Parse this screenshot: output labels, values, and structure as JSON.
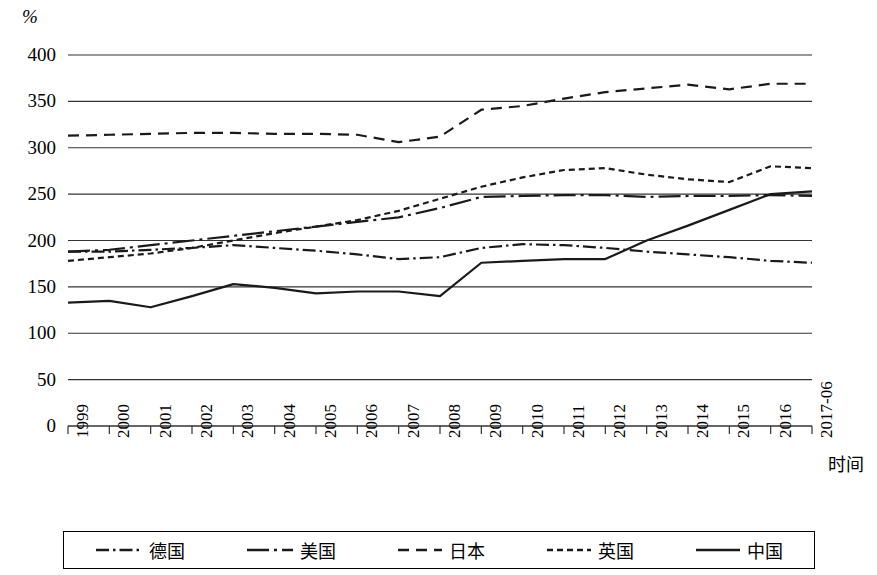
{
  "chart_data": {
    "type": "line",
    "title": "",
    "xlabel": "时间",
    "ylabel": "%",
    "y_unit_symbol": "%",
    "ylim": [
      0,
      400
    ],
    "y_ticks": [
      0,
      50,
      100,
      150,
      200,
      250,
      300,
      350,
      400
    ],
    "grid": true,
    "grid_axis": "y",
    "legend_position": "bottom",
    "x": [
      "1999",
      "2000",
      "2001",
      "2002",
      "2003",
      "2004",
      "2005",
      "2006",
      "2007",
      "2008",
      "2009",
      "2010",
      "2011",
      "2012",
      "2013",
      "2014",
      "2015",
      "2016",
      "2017-06"
    ],
    "categories": [
      "1999",
      "2000",
      "2001",
      "2002",
      "2003",
      "2004",
      "2005",
      "2006",
      "2007",
      "2008",
      "2009",
      "2010",
      "2011",
      "2012",
      "2013",
      "2014",
      "2015",
      "2016",
      "2017-06"
    ],
    "series": [
      {
        "name": "德国",
        "style": "dash-dot",
        "color": "#1a1a1a",
        "values": [
          188,
          188,
          190,
          192,
          195,
          192,
          189,
          185,
          180,
          182,
          192,
          196,
          195,
          192,
          188,
          185,
          182,
          178,
          176
        ]
      },
      {
        "name": "美国",
        "style": "long-dash-dot",
        "color": "#1a1a1a",
        "values": [
          188,
          190,
          195,
          200,
          205,
          210,
          215,
          220,
          225,
          235,
          247,
          248,
          249,
          249,
          247,
          248,
          248,
          249,
          248
        ]
      },
      {
        "name": "日本",
        "style": "dashed",
        "color": "#1a1a1a",
        "values": [
          313,
          314,
          315,
          316,
          316,
          315,
          315,
          314,
          306,
          312,
          341,
          345,
          353,
          360,
          364,
          368,
          363,
          369,
          369
        ]
      },
      {
        "name": "英国",
        "style": "dotted",
        "color": "#1a1a1a",
        "values": [
          178,
          182,
          186,
          192,
          200,
          208,
          215,
          222,
          232,
          245,
          258,
          268,
          276,
          278,
          271,
          266,
          263,
          280,
          278
        ]
      },
      {
        "name": "中国",
        "style": "solid",
        "color": "#1a1a1a",
        "values": [
          133,
          135,
          128,
          140,
          153,
          149,
          143,
          145,
          145,
          140,
          176,
          178,
          180,
          180,
          200,
          216,
          233,
          250,
          253
        ]
      }
    ]
  },
  "axis": {
    "y_unit": "%",
    "x_title": "时间",
    "y_tick_labels": [
      "400",
      "350",
      "300",
      "250",
      "200",
      "150",
      "100",
      "50",
      "0"
    ],
    "x_tick_labels": [
      "1999",
      "2000",
      "2001",
      "2002",
      "2003",
      "2004",
      "2005",
      "2006",
      "2007",
      "2008",
      "2009",
      "2010",
      "2011",
      "2012",
      "2013",
      "2014",
      "2015",
      "2016",
      "2017-06"
    ]
  },
  "legend": {
    "items": [
      {
        "label": "德国",
        "style": "dash-dot"
      },
      {
        "label": "美国",
        "style": "long-dash-dot"
      },
      {
        "label": "日本",
        "style": "dashed"
      },
      {
        "label": "英国",
        "style": "dotted"
      },
      {
        "label": "中国",
        "style": "solid"
      }
    ]
  }
}
